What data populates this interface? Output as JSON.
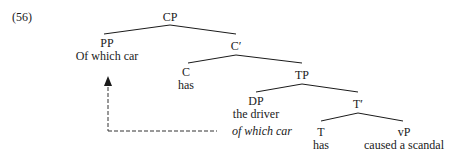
{
  "example_number": "(56)",
  "nodes": {
    "cp": "CP",
    "pp": "PP",
    "pp_text": "Of which car",
    "cbar": "C′",
    "c": "C",
    "c_text": "has",
    "tp": "TP",
    "dp": "DP",
    "dp_text1": "the driver",
    "dp_text2": "of which car",
    "tbar": "T′",
    "t": "T",
    "t_text": "has",
    "vp": "vP",
    "vp_text": "caused a scandal"
  }
}
